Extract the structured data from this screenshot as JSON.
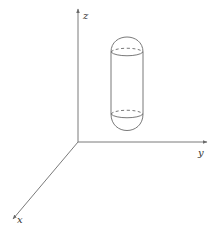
{
  "diagram": {
    "title": "",
    "axes": {
      "x": {
        "label": "x"
      },
      "y": {
        "label": "y"
      },
      "z": {
        "label": "z"
      }
    },
    "object": {
      "type": "capsule",
      "description": "Vertical capsule (cylinder with hemispherical caps), hidden edges dashed"
    },
    "colors": {
      "axis": "#7a7a7a",
      "shape": "#6a6a6a",
      "label": "#333333",
      "background": "#ffffff"
    }
  }
}
